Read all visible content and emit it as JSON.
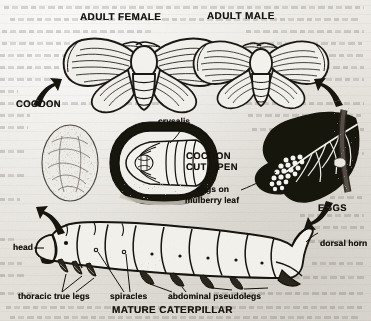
{
  "figure": {
    "caption": "MATURE CATERPILLAR",
    "medium": "scanned-textbook-line-drawing",
    "ink_color": "#16130f",
    "paper_color": "#e9e7e2"
  },
  "labels": {
    "adult_female": "ADULT FEMALE",
    "adult_male": "ADULT MALE",
    "cocoon": "COCOON",
    "crysalis": "crysalis",
    "cocoon_cut_open_line1": "COCOON",
    "cocoon_cut_open_line2": "CUT OPEN",
    "eggs_on_line1": "eggs on",
    "eggs_on_line2": "mulberry leaf",
    "eggs": "EGGS",
    "head": "head",
    "dorsal_horn": "dorsal horn",
    "thoracic_true_legs": "thoracic true legs",
    "spiracles": "spiracles",
    "abdominal_pseudolegs": "abdominal pseudolegs",
    "mature_caterpillar": "MATURE CATERPILLAR"
  },
  "illustrations": [
    {
      "name": "adult-female-moth",
      "kind": "line-drawing"
    },
    {
      "name": "adult-male-moth",
      "kind": "line-drawing"
    },
    {
      "name": "intact-cocoon",
      "kind": "stippled-oval"
    },
    {
      "name": "cocoon-cut-open",
      "kind": "cutaway-with-chrysalis"
    },
    {
      "name": "mulberry-leaf-with-eggs",
      "kind": "silhouette"
    },
    {
      "name": "mature-caterpillar",
      "kind": "line-drawing"
    }
  ],
  "arrows": [
    {
      "name": "arrow-to-cocoon",
      "direction": "up-right"
    },
    {
      "name": "arrow-to-adult-male",
      "direction": "up-left"
    },
    {
      "name": "arrow-to-eggs",
      "direction": "down-left"
    },
    {
      "name": "arrow-to-caterpillar",
      "direction": "up-left"
    }
  ]
}
